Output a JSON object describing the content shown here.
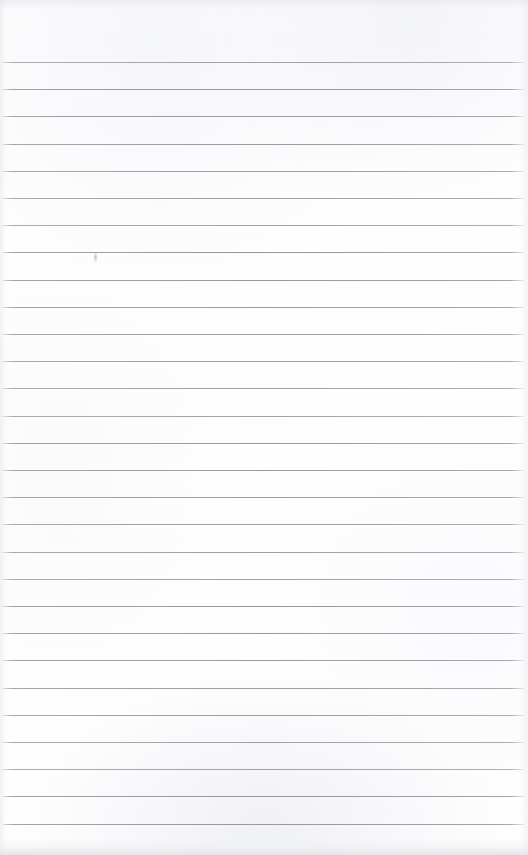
{
  "document": {
    "kind": "scanned-ruled-notebook-page",
    "title": "Blank Ruled Notebook Page",
    "description": "A scanned blank lined notebook sheet with horizontal ruled lines and no handwritten content.",
    "text_content": "",
    "page_width": 528,
    "page_height": 855,
    "paper_color": "#fefeff",
    "rule_color": "#9a9a9e",
    "shadow_color": "#e2e4e8"
  },
  "ruling": {
    "style": "wide-ruled-horizontal",
    "first_line_y": 62,
    "line_pitch": 27.2,
    "line_count": 29,
    "line_thickness": 1,
    "line_start_x": 2,
    "line_end_x": 524,
    "top_margin_label": "header margin",
    "top_margin_height": 62,
    "line_y_positions": [
      62,
      89.2,
      116.4,
      143.6,
      170.8,
      198,
      225.2,
      252.4,
      279.6,
      306.8,
      334,
      361.2,
      388.4,
      415.6,
      442.8,
      470,
      497.2,
      524.4,
      551.6,
      578.8,
      606,
      633.2,
      660.4,
      687.6,
      714.8,
      742,
      769.2,
      796.4,
      823.6
    ]
  },
  "marks": [
    {
      "name": "pencil-smudge",
      "x": 92,
      "y": 252,
      "width": 7,
      "height": 12,
      "note": "faint vertical pencil smudge above the ruled line"
    }
  ]
}
